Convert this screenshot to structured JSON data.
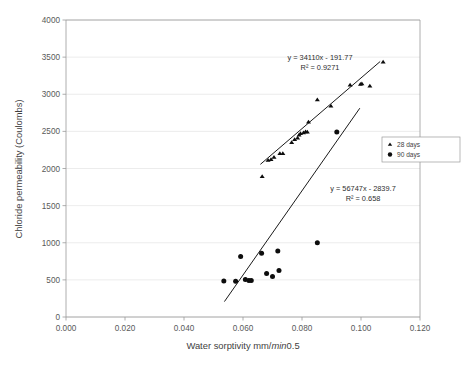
{
  "chart_data": {
    "type": "scatter",
    "title": "",
    "xlabel": "Water sorptivity mm/min0.5",
    "xlabel_parts": {
      "pre": "Water sorptivity mm/",
      "italic": "min",
      "post": "0.5"
    },
    "ylabel": "Chloride permeability (Coulombs)",
    "xlim": [
      0.0,
      0.12
    ],
    "ylim": [
      0,
      4000
    ],
    "xticks": [
      "0.000",
      "0.020",
      "0.040",
      "0.060",
      "0.080",
      "0.100",
      "0.120"
    ],
    "xtick_values": [
      0.0,
      0.02,
      0.04,
      0.06,
      0.08,
      0.1,
      0.12
    ],
    "yticks": [
      "0",
      "500",
      "1000",
      "1500",
      "2000",
      "2500",
      "3000",
      "3500",
      "4000"
    ],
    "ytick_values": [
      0,
      500,
      1000,
      1500,
      2000,
      2500,
      3000,
      3500,
      4000
    ],
    "grid": "horizontal",
    "legend_position": "right",
    "series": [
      {
        "name": "28 days",
        "marker": "triangle",
        "color": "#0d0d0d",
        "points": [
          [
            0.0665,
            1890
          ],
          [
            0.0685,
            2110
          ],
          [
            0.0695,
            2120
          ],
          [
            0.0705,
            2150
          ],
          [
            0.0725,
            2200
          ],
          [
            0.0735,
            2200
          ],
          [
            0.0765,
            2350
          ],
          [
            0.0775,
            2390
          ],
          [
            0.0785,
            2410
          ],
          [
            0.079,
            2450
          ],
          [
            0.0795,
            2470
          ],
          [
            0.0805,
            2480
          ],
          [
            0.0812,
            2495
          ],
          [
            0.0818,
            2490
          ],
          [
            0.0822,
            2625
          ],
          [
            0.0852,
            2925
          ],
          [
            0.0898,
            2840
          ],
          [
            0.0963,
            3125
          ],
          [
            0.0998,
            3135
          ],
          [
            0.1003,
            3140
          ],
          [
            0.103,
            3110
          ],
          [
            0.1075,
            3435
          ]
        ],
        "trendline": {
          "equation": "y = 34110x - 191.77",
          "r2_label": "R² = 0.9271",
          "slope": 34110,
          "intercept": -191.77,
          "r2": 0.9271,
          "x_from": 0.0659,
          "x_to": 0.1065
        }
      },
      {
        "name": "90 days",
        "marker": "circle",
        "color": "#0d0d0d",
        "points": [
          [
            0.0535,
            485
          ],
          [
            0.0575,
            480
          ],
          [
            0.0592,
            815
          ],
          [
            0.0608,
            505
          ],
          [
            0.062,
            490
          ],
          [
            0.0628,
            490
          ],
          [
            0.0663,
            860
          ],
          [
            0.068,
            585
          ],
          [
            0.07,
            545
          ],
          [
            0.0718,
            890
          ],
          [
            0.0722,
            625
          ],
          [
            0.0852,
            1000
          ],
          [
            0.0918,
            2490
          ]
        ],
        "trendline": {
          "equation": "y = 56747x - 2839.7",
          "r2_label": "R² = 0.658",
          "slope": 56747,
          "intercept": -2839.7,
          "r2": 0.658,
          "x_from": 0.0537,
          "x_to": 0.0996
        }
      }
    ],
    "annotations": [
      {
        "name": "equation-28-days",
        "lines": [
          "y = 34110x - 191.77",
          "R² = 0.9271"
        ],
        "x_px": 320,
        "y_px": 60
      },
      {
        "name": "equation-90-days",
        "lines": [
          "y = 56747x - 2839.7",
          "R² = 0.658"
        ],
        "x_px": 363,
        "y_px": 191
      }
    ],
    "legend_entries": [
      {
        "label": "28 days",
        "marker": "triangle"
      },
      {
        "label": "90 days",
        "marker": "circle"
      }
    ]
  }
}
